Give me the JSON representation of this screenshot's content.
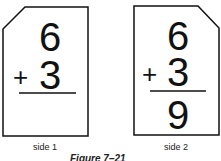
{
  "cards": [
    {
      "label": "side 1",
      "top": "6",
      "operator": "+",
      "bottom": "3",
      "answer": ""
    },
    {
      "label": "side 2",
      "top": "6",
      "operator": "+",
      "bottom": "3",
      "answer": "9"
    }
  ],
  "caption": "Figure 7–21",
  "colors": {
    "stroke": "#111111",
    "background": "#ffffff"
  }
}
